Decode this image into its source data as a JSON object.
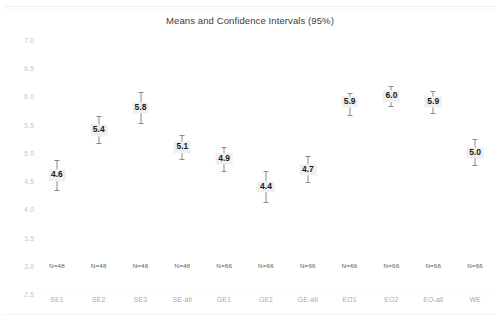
{
  "chart_data": {
    "type": "scatter",
    "title": "Means and Confidence Intervals (95%)",
    "xlabel": "",
    "ylabel": "",
    "ylim": [
      2.5,
      7.0
    ],
    "ytick_step": 0.5,
    "grid": false,
    "legend": null,
    "categories": [
      "SE1",
      "SE2",
      "SE3",
      "SE-all",
      "GE1",
      "GE2",
      "GE-all",
      "EO1",
      "EO2",
      "EO-all",
      "WE"
    ],
    "ytick_labels": [
      "7.0",
      "6.5",
      "6.0",
      "5.5",
      "5.0",
      "4.5",
      "4.0",
      "3.5",
      "3.0",
      "2.5"
    ],
    "ytick_values": [
      7.0,
      6.5,
      6.0,
      5.5,
      5.0,
      4.5,
      4.0,
      3.5,
      3.0,
      2.5
    ],
    "series": [
      {
        "name": "Mean with 95% CI",
        "values": [
          4.6,
          5.4,
          5.8,
          5.1,
          4.9,
          4.4,
          4.7,
          5.9,
          6.0,
          5.9,
          5.0
        ],
        "ci_lower": [
          4.33,
          5.15,
          5.52,
          4.87,
          4.67,
          4.12,
          4.46,
          5.65,
          5.81,
          5.69,
          4.77
        ],
        "ci_upper": [
          4.87,
          5.66,
          6.08,
          5.31,
          5.11,
          4.68,
          4.94,
          6.06,
          6.19,
          6.09,
          5.24
        ]
      }
    ],
    "value_labels": [
      "4.6",
      "5.4",
      "5.8",
      "5.1",
      "4.9",
      "4.4",
      "4.7",
      "5.9",
      "6.0",
      "5.9",
      "5.0"
    ],
    "sample_sizes": [
      "N=48",
      "N=48",
      "N=48",
      "N=48",
      "N=66",
      "N=66",
      "N=66",
      "N=66",
      "N=66",
      "N=66",
      "N=66"
    ],
    "colors": {
      "marker": "#8a8a8a",
      "label_background": "#efefef",
      "label_text": "#1a1a1a",
      "tick_text": "#c2c2c2",
      "category_text": "#a9a9a9",
      "n_text": "#5a5a5a",
      "title_text": "#3d3d3d",
      "background": "#ffffff"
    }
  }
}
